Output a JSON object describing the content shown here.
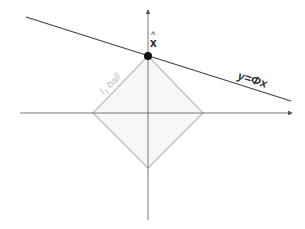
{
  "diagram": {
    "type": "geometric-illustration",
    "labels": {
      "ball": "l₁ ball",
      "ball_main": "l",
      "ball_sub": "1",
      "ball_word": "ball",
      "point_hat": "^",
      "point": "x",
      "line": "y=Φx"
    },
    "colors": {
      "axis": "#555555",
      "line": "#444444",
      "ball_stroke": "#c0c0c0",
      "ball_fill": "#f7f7f7",
      "ball_label": "#bdbdbd",
      "point": "#111111"
    },
    "elements": {
      "horizontal_axis": {
        "from": [
          20,
          113
        ],
        "to": [
          292,
          113
        ]
      },
      "vertical_axis": {
        "from": [
          148,
          220
        ],
        "to": [
          148,
          9
        ]
      },
      "diamond": {
        "top": [
          148,
          56
        ],
        "right": [
          203,
          113
        ],
        "bottom": [
          148,
          168
        ],
        "left": [
          93,
          113
        ]
      },
      "line": {
        "from": [
          26,
          17
        ],
        "to": [
          291,
          101
        ]
      },
      "point": {
        "center": [
          148,
          56
        ],
        "radius": 4
      }
    }
  }
}
